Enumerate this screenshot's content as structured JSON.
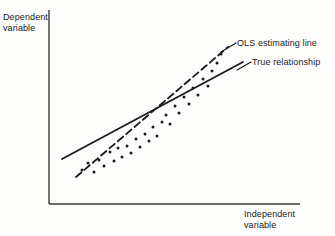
{
  "figure": {
    "background_color": "#fdfdfc",
    "ink_color": "#1a1a1a"
  },
  "axes": {
    "y_axis_label": "Dependent\nvariable",
    "x_axis_label": "Independent\nvariable",
    "y_axis": {
      "x": 49,
      "y_top": 10,
      "y_bottom": 204
    },
    "x_axis": {
      "y": 204,
      "x_left": 49,
      "x_right": 300
    },
    "axis_color": "#3a3a3a",
    "axis_width": 1.4,
    "ticks": [],
    "grid": false
  },
  "legend": {
    "position": "inline-annotation",
    "entries": [
      {
        "name": "ols-estimating-line",
        "label": "OLS estimating line",
        "style": "dashed",
        "label_x": 237,
        "label_y": 38,
        "leader": {
          "x1": 221,
          "y1": 52,
          "x2": 236,
          "y2": 43
        }
      },
      {
        "name": "true-relationship",
        "label": "True relationship",
        "style": "solid",
        "label_x": 252,
        "label_y": 57,
        "leader": {
          "x1": 237,
          "y1": 70,
          "x2": 251,
          "y2": 62
        }
      }
    ]
  },
  "chart_data": {
    "type": "scatter",
    "title": "",
    "subtitle": "",
    "xlabel": "Independent variable",
    "ylabel": "Dependent variable",
    "xlim": [
      49,
      300
    ],
    "ylim": [
      204,
      10
    ],
    "grid": false,
    "legend_position": "inline-annotation",
    "tick_labels": {
      "x": [],
      "y": []
    },
    "annotations": [
      "OLS estimating line",
      "True relationship"
    ],
    "series": [
      {
        "name": "True relationship",
        "type": "line",
        "style": "solid",
        "color": "#1a1a1a",
        "width": 1.8,
        "points": [
          [
            62,
            159
          ],
          [
            243,
            62
          ]
        ]
      },
      {
        "name": "OLS estimating line",
        "type": "line",
        "style": "dashed",
        "color": "#1a1a1a",
        "width": 1.8,
        "dash": "7,4",
        "points": [
          [
            76,
            177
          ],
          [
            228,
            47
          ]
        ]
      },
      {
        "name": "observations",
        "type": "scatter",
        "color": "#1a1a1a",
        "marker_size": 1.5,
        "points": [
          [
            82,
            170
          ],
          [
            88,
            163
          ],
          [
            94,
            172
          ],
          [
            99,
            160
          ],
          [
            104,
            166
          ],
          [
            110,
            152
          ],
          [
            114,
            161
          ],
          [
            118,
            148
          ],
          [
            122,
            157
          ],
          [
            127,
            146
          ],
          [
            131,
            153
          ],
          [
            136,
            139
          ],
          [
            140,
            147
          ],
          [
            145,
            134
          ],
          [
            149,
            141
          ],
          [
            153,
            127
          ],
          [
            157,
            136
          ],
          [
            162,
            122
          ],
          [
            166,
            115
          ],
          [
            170,
            124
          ],
          [
            175,
            106
          ],
          [
            179,
            113
          ],
          [
            184,
            97
          ],
          [
            189,
            104
          ],
          [
            193,
            88
          ],
          [
            198,
            95
          ],
          [
            203,
            79
          ],
          [
            208,
            86
          ],
          [
            212,
            71
          ],
          [
            217,
            63
          ],
          [
            221,
            54
          ]
        ]
      }
    ]
  }
}
